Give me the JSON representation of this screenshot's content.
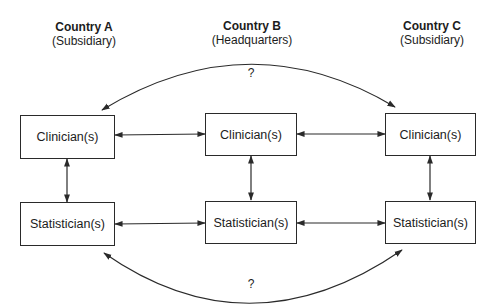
{
  "countries": [
    {
      "name": "Country A",
      "role": "(Subsidiary)"
    },
    {
      "name": "Country B",
      "role": "(Headquarters)"
    },
    {
      "name": "Country C",
      "role": "(Subsidiary)"
    }
  ],
  "rows": {
    "clinician": {
      "label": "Clinician(s)"
    },
    "statistician": {
      "label": "Statistician(s)"
    }
  },
  "boxes": [
    {
      "id": "clinician-a",
      "label": "Clinician(s)"
    },
    {
      "id": "clinician-b",
      "label": "Clinician(s)"
    },
    {
      "id": "clinician-c",
      "label": "Clinician(s)"
    },
    {
      "id": "statistician-a",
      "label": "Statistician(s)"
    },
    {
      "id": "statistician-b",
      "label": "Statistician(s)"
    },
    {
      "id": "statistician-c",
      "label": "Statistician(s)"
    }
  ],
  "arcs": {
    "top": {
      "label": "?",
      "connects": [
        "clinician-a",
        "clinician-c"
      ]
    },
    "bottom": {
      "label": "?",
      "connects": [
        "statistician-a",
        "statistician-c"
      ]
    }
  },
  "colors": {
    "stroke": "#2a2a2a",
    "background": "#ffffff"
  }
}
